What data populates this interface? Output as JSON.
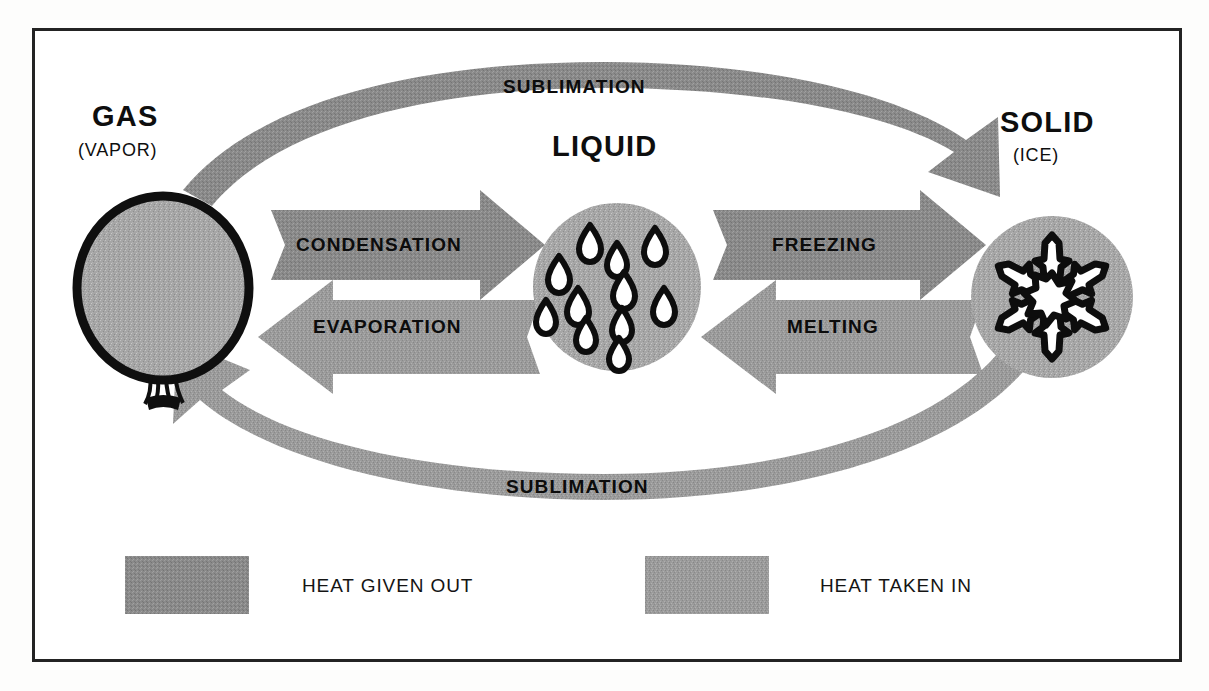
{
  "diagram": {
    "frame": {
      "visible": true,
      "color": "#232323"
    },
    "colors": {
      "arrow_gray": "#8a8a8a",
      "arrow_gray_light": "#9b9b9b",
      "heat_given_out_swatch": "#858585",
      "heat_taken_in_swatch": "#9a9a9a",
      "outline_black": "#111111",
      "fill_white": "#ffffff",
      "page_white": "#ffffff"
    },
    "states": [
      {
        "id": "gas",
        "title": "GAS",
        "subtitle": "(VAPOR)",
        "shape": "balloon-icon"
      },
      {
        "id": "liquid",
        "title": "LIQUID",
        "subtitle": "",
        "shape": "droplets-circle-icon"
      },
      {
        "id": "solid",
        "title": "SOLID",
        "subtitle": "(ICE)",
        "shape": "snowflake-circle-icon"
      }
    ],
    "transitions": [
      {
        "id": "sublimation-top",
        "label": "SUBLIMATION",
        "from": "gas",
        "to": "solid",
        "direction": "right",
        "path": "curve-top"
      },
      {
        "id": "condensation",
        "label": "CONDENSATION",
        "from": "gas",
        "to": "liquid",
        "direction": "right",
        "path": "straight"
      },
      {
        "id": "freezing",
        "label": "FREEZING",
        "from": "liquid",
        "to": "solid",
        "direction": "right",
        "path": "straight"
      },
      {
        "id": "evaporation",
        "label": "EVAPORATION",
        "from": "liquid",
        "to": "gas",
        "direction": "left",
        "path": "straight"
      },
      {
        "id": "melting",
        "label": "MELTING",
        "from": "solid",
        "to": "liquid",
        "direction": "left",
        "path": "straight"
      },
      {
        "id": "sublimation-bottom",
        "label": "SUBLIMATION",
        "from": "solid",
        "to": "gas",
        "direction": "left",
        "path": "curve-bottom"
      }
    ],
    "legend": {
      "items": [
        {
          "id": "heat-given-out",
          "label": "HEAT GIVEN OUT",
          "color": "#858585"
        },
        {
          "id": "heat-taken-in",
          "label": "HEAT TAKEN IN",
          "color": "#9a9a9a"
        }
      ]
    }
  }
}
